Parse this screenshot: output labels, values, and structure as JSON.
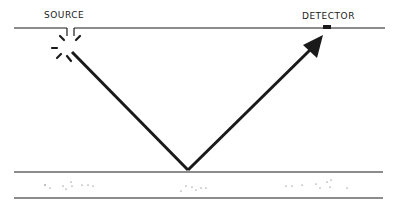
{
  "labels": {
    "source": "SOURCE",
    "detector": "DETECTOR"
  },
  "colors": {
    "ink": "#1a1a1a",
    "background": "#ffffff"
  },
  "diagram": {
    "type": "reflection-path",
    "elements": [
      "top-surface-line",
      "source",
      "incident-ray",
      "reflection-point",
      "reflected-ray-arrow",
      "detector",
      "lower-layer-band"
    ]
  }
}
